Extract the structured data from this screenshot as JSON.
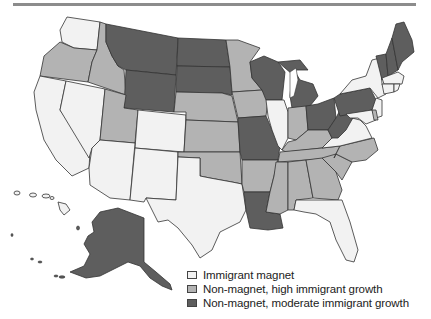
{
  "map": {
    "type": "choropleth",
    "region": "United States",
    "colors": {
      "immigrant_magnet": "#f2f2f2",
      "high_growth": "#b3b3b3",
      "moderate_growth": "#5e5e5e"
    },
    "states": {
      "immigrant_magnet": [
        "WA",
        "CA",
        "NV",
        "AZ",
        "CO",
        "NM",
        "TX",
        "IL",
        "NY",
        "NJ",
        "MA",
        "RI",
        "CT",
        "MD",
        "VA",
        "FL",
        "DC",
        "HI"
      ],
      "high_growth": [
        "OR",
        "ID",
        "UT",
        "NE",
        "KS",
        "OK",
        "MN",
        "IA",
        "AR",
        "IN",
        "KY",
        "TN",
        "MS",
        "AL",
        "GA",
        "SC",
        "NC",
        "DE"
      ],
      "moderate_growth": [
        "MT",
        "WY",
        "ND",
        "SD",
        "MO",
        "LA",
        "WI",
        "MI",
        "OH",
        "PA",
        "WV",
        "VT",
        "NH",
        "ME",
        "AK"
      ]
    }
  },
  "legend": {
    "items": [
      {
        "label": "Immigrant magnet",
        "color": "#f2f2f2"
      },
      {
        "label": "Non-magnet, high immigrant growth",
        "color": "#b3b3b3"
      },
      {
        "label": "Non-magnet, moderate immigrant growth",
        "color": "#5e5e5e"
      }
    ]
  }
}
